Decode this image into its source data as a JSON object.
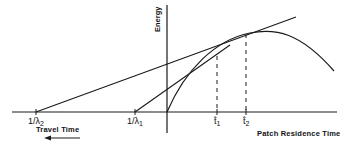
{
  "diagram": {
    "y_axis_label": "Energy",
    "x_axis_label": "Patch Residence Time",
    "travel_label": "Travel Time",
    "ticks": {
      "lambda2": {
        "num": "1/",
        "sym": "λ",
        "sub": "2"
      },
      "lambda1": {
        "num": "1/",
        "sym": "λ",
        "sub": "1"
      },
      "t1": {
        "sym": "t̂",
        "sub": "1"
      },
      "t2": {
        "sym": "t̂",
        "sub": "2"
      }
    },
    "colors": {
      "ink": "#1a1a1a",
      "background": "#ffffff"
    }
  }
}
